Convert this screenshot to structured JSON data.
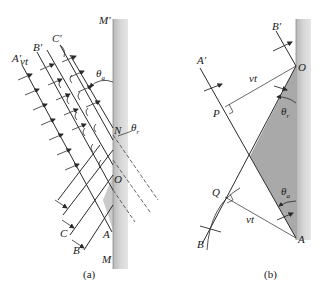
{
  "figure": {
    "colors": {
      "mirror": "#c8c8c8",
      "mirror_edge": "#8a8a8a",
      "shaded_region": "#a9a9a9",
      "line": "#2a2a2a"
    }
  },
  "panel_a": {
    "caption": "(a)",
    "labels": {
      "mirror_top": "M′",
      "mirror_bottom": "M",
      "wavefront_a_top": "A′",
      "wavefront_b_top": "B′",
      "wavefront_c_top": "C′",
      "wavefront_a_bottom": "A",
      "wavefront_b_bottom": "B",
      "wavefront_c_bottom": "C",
      "point_n": "N",
      "point_o": "O",
      "theta_a": "θ",
      "theta_a_sub": "a",
      "theta_r": "θ",
      "theta_r_sub": "r",
      "distance": "vt"
    }
  },
  "panel_b": {
    "caption": "(b)",
    "labels": {
      "wavefront_a_top": "A′",
      "wavefront_b_top": "B′",
      "point_o": "O",
      "point_p": "P",
      "point_q": "Q",
      "point_a": "A",
      "point_b": "B",
      "distance_top": "vt",
      "distance_bottom": "vt",
      "theta_r": "θ",
      "theta_r_sub": "r",
      "theta_a": "θ",
      "theta_a_sub": "a"
    }
  }
}
